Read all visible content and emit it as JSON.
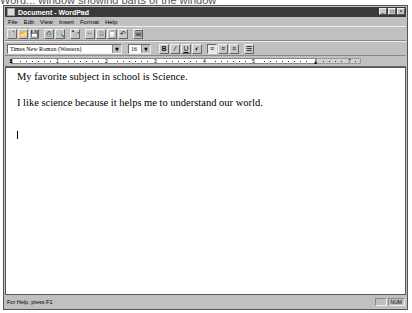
{
  "caption": "Word... window showing parts of the window",
  "window": {
    "title": "Document - WordPad",
    "controls": [
      "minimize",
      "maximize",
      "close"
    ]
  },
  "menu": {
    "items": [
      {
        "label": "File"
      },
      {
        "label": "Edit"
      },
      {
        "label": "View"
      },
      {
        "label": "Insert"
      },
      {
        "label": "Format"
      },
      {
        "label": "Help"
      }
    ]
  },
  "toolbar": {
    "buttons": [
      {
        "name": "new",
        "glyph": "🗋",
        "enabled": true
      },
      {
        "name": "open",
        "glyph": "📂",
        "enabled": true
      },
      {
        "name": "save",
        "glyph": "💾",
        "enabled": true
      },
      {
        "name": "print",
        "glyph": "⎙",
        "enabled": true
      },
      {
        "name": "print-preview",
        "glyph": "🔍",
        "enabled": true
      },
      {
        "name": "find",
        "glyph": "🔭",
        "enabled": true
      },
      {
        "name": "cut",
        "glyph": "✂",
        "enabled": false
      },
      {
        "name": "copy",
        "glyph": "⧉",
        "enabled": false
      },
      {
        "name": "paste",
        "glyph": "📋",
        "enabled": true
      },
      {
        "name": "undo",
        "glyph": "↶",
        "enabled": true
      },
      {
        "name": "insert-date-time",
        "glyph": "🗓",
        "enabled": true
      }
    ]
  },
  "format_bar": {
    "font": "Times New Roman (Western)",
    "size": "16",
    "bold_glyph": "B",
    "italic_glyph": "/",
    "underline_glyph": "U",
    "color_glyph": "◐",
    "align_left_glyph": "≡",
    "align_center_glyph": "≡",
    "align_right_glyph": "≡",
    "bullets_glyph": "☰"
  },
  "ruler": {
    "numbers": [
      "1",
      "2",
      "3",
      "4",
      "5",
      "6",
      "7"
    ]
  },
  "document": {
    "lines": [
      "My favorite subject in school is Science.",
      "I like science because it helps me to understand our world."
    ]
  },
  "status": {
    "help_text": "For Help, press F1",
    "num_indicator": "NUM"
  }
}
